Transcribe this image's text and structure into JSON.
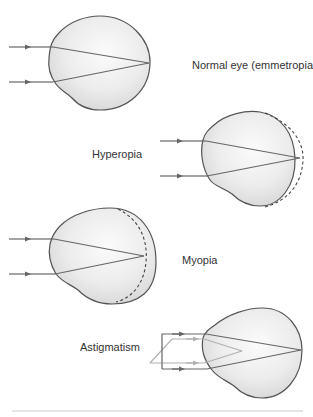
{
  "figure": {
    "labels": {
      "normal": "Normal eye (emmetropia)",
      "hyperopia": "Hyperopia",
      "myopia": "Myopia",
      "astigmatism": "Astigmatism"
    },
    "colors": {
      "eye_outline": "#555555",
      "eye_fill_light": "#fafafa",
      "eye_fill_dark": "#d8d8d8",
      "ray_dark": "#666666",
      "ray_light": "#b0b0b0",
      "retina_dashed": "#444444",
      "divider": "#cccccc",
      "label_text": "#333333"
    },
    "panels": [
      {
        "name": "normal",
        "description": "Parallel rays focus exactly on the retina"
      },
      {
        "name": "hyperopia",
        "description": "Eyeball too short; focus point falls behind the retina (dashed line)"
      },
      {
        "name": "myopia",
        "description": "Eyeball too long; focus point falls in front of the retina (dashed line)"
      },
      {
        "name": "astigmatism",
        "description": "Rays in different planes focus at different points"
      }
    ]
  }
}
